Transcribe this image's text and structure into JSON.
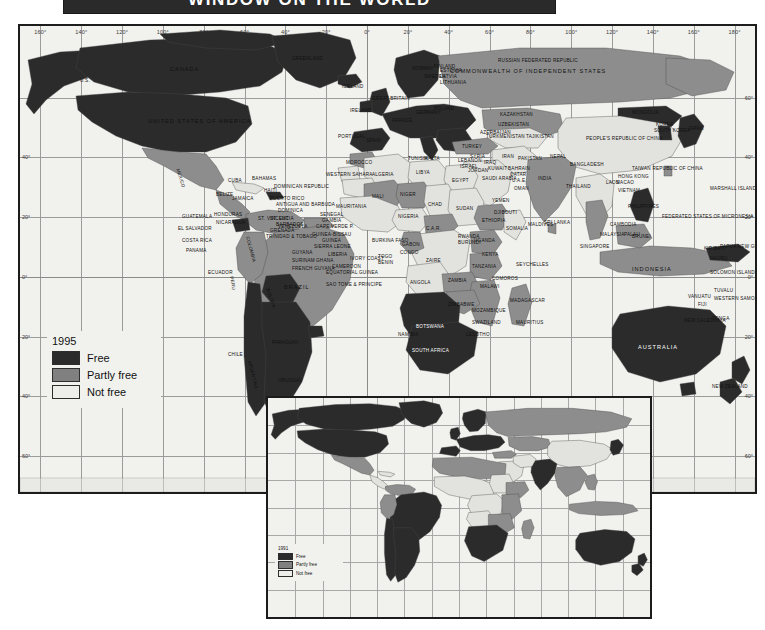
{
  "title": "WINDOW ON THE WORLD",
  "legend_main": {
    "year": "1995",
    "items": [
      {
        "label": "Free",
        "color": "#2b2b2b"
      },
      {
        "label": "Partly free",
        "color": "#808080"
      },
      {
        "label": "Not free",
        "color": "#ededea"
      }
    ]
  },
  "legend_inset": {
    "year": "1991",
    "items": [
      {
        "label": "Free",
        "color": "#2b2b2b"
      },
      {
        "label": "Partly free",
        "color": "#808080"
      },
      {
        "label": "Not free",
        "color": "#ededea"
      }
    ]
  },
  "graticule": {
    "lon_labels": [
      "160°",
      "140°",
      "120°",
      "100°",
      "80°",
      "60°",
      "40°",
      "20°",
      "0°",
      "20°",
      "40°",
      "60°",
      "80°",
      "100°",
      "120°",
      "140°",
      "160°",
      "180°"
    ],
    "lat_labels_left": [
      "40°",
      "20°",
      "0°",
      "20°",
      "40°",
      "60°"
    ],
    "lat_labels_right": [
      "60°",
      "40°",
      "20°",
      "0°",
      "20°",
      "40°",
      "60°"
    ]
  },
  "chart_data": {
    "type": "map",
    "title": "WINDOW ON THE WORLD",
    "categories": [
      "Free",
      "Partly free",
      "Not free"
    ],
    "category_colors": [
      "#2b2b2b",
      "#808080",
      "#ededea"
    ],
    "years": [
      "1995",
      "1991"
    ],
    "projection": "cylindrical",
    "grid": true,
    "legend_position": "bottom-left",
    "countries": [
      {
        "name": "U.S.",
        "status": "Free"
      },
      {
        "name": "CANADA",
        "status": "Free"
      },
      {
        "name": "UNITED STATES OF AMERICA",
        "status": "Free"
      },
      {
        "name": "GREENLAND",
        "status": "Free"
      },
      {
        "name": "ICELAND",
        "status": "Free"
      },
      {
        "name": "NORWAY",
        "status": "Free"
      },
      {
        "name": "SWEDEN",
        "status": "Free"
      },
      {
        "name": "FINLAND",
        "status": "Free"
      },
      {
        "name": "GREAT BRITAIN",
        "status": "Free"
      },
      {
        "name": "IRELAND",
        "status": "Free"
      },
      {
        "name": "PORTUGAL",
        "status": "Free"
      },
      {
        "name": "SPAIN",
        "status": "Free"
      },
      {
        "name": "FRANCE",
        "status": "Free"
      },
      {
        "name": "GERMANY",
        "status": "Free"
      },
      {
        "name": "POLAND",
        "status": "Free"
      },
      {
        "name": "ESTONIA",
        "status": "Free"
      },
      {
        "name": "LATVIA",
        "status": "Free"
      },
      {
        "name": "LITHUANIA",
        "status": "Free"
      },
      {
        "name": "MALTA",
        "status": "Free"
      },
      {
        "name": "RUSSIAN FEDERATED REPUBLIC",
        "status": "Partly free"
      },
      {
        "name": "COMMONWEALTH OF INDEPENDENT STATES",
        "status": "Partly free"
      },
      {
        "name": "KAZAKHSTAN",
        "status": "Partly free"
      },
      {
        "name": "UZBEKISTAN",
        "status": "Not free"
      },
      {
        "name": "TURKMENISTAN",
        "status": "Not free"
      },
      {
        "name": "TAJIKISTAN",
        "status": "Not free"
      },
      {
        "name": "AZERBAIJAN",
        "status": "Partly free"
      },
      {
        "name": "MONGOLIA",
        "status": "Free"
      },
      {
        "name": "PEOPLE'S REPUBLIC OF CHINA",
        "status": "Not free"
      },
      {
        "name": "KOREA",
        "status": "Not free"
      },
      {
        "name": "SOUTH KOREA",
        "status": "Free"
      },
      {
        "name": "JAPAN",
        "status": "Free"
      },
      {
        "name": "TAIWAN REPUBLIC OF CHINA",
        "status": "Partly free"
      },
      {
        "name": "HONG KONG",
        "status": "Partly free"
      },
      {
        "name": "MACAO",
        "status": "Partly free"
      },
      {
        "name": "PHILIPPINES",
        "status": "Free"
      },
      {
        "name": "INDONESIA",
        "status": "Partly free"
      },
      {
        "name": "MALAYSIA",
        "status": "Partly free"
      },
      {
        "name": "BRUNEI",
        "status": "Not free"
      },
      {
        "name": "SINGAPORE",
        "status": "Partly free"
      },
      {
        "name": "CAMBODIA",
        "status": "Partly free"
      },
      {
        "name": "VIETNAM",
        "status": "Not free"
      },
      {
        "name": "LAOS",
        "status": "Not free"
      },
      {
        "name": "THAILAND",
        "status": "Partly free"
      },
      {
        "name": "INDIA",
        "status": "Partly free"
      },
      {
        "name": "PAKISTAN",
        "status": "Partly free"
      },
      {
        "name": "NEPAL",
        "status": "Partly free"
      },
      {
        "name": "BANGLADESH",
        "status": "Partly free"
      },
      {
        "name": "SRI LANKA",
        "status": "Partly free"
      },
      {
        "name": "MALDIVES",
        "status": "Not free"
      },
      {
        "name": "IRAN",
        "status": "Not free"
      },
      {
        "name": "IRAQ",
        "status": "Not free"
      },
      {
        "name": "TURKEY",
        "status": "Partly free"
      },
      {
        "name": "SAUDI ARABIA",
        "status": "Not free"
      },
      {
        "name": "BAHRAIN",
        "status": "Not free"
      },
      {
        "name": "QATAR",
        "status": "Not free"
      },
      {
        "name": "U.A.E.",
        "status": "Not free"
      },
      {
        "name": "OMAN",
        "status": "Not free"
      },
      {
        "name": "YEMEN",
        "status": "Partly free"
      },
      {
        "name": "ISRAEL",
        "status": "Free"
      },
      {
        "name": "JORDAN",
        "status": "Partly free"
      },
      {
        "name": "SYRIA",
        "status": "Not free"
      },
      {
        "name": "LEBANON",
        "status": "Not free"
      },
      {
        "name": "KUWAIT",
        "status": "Partly free"
      },
      {
        "name": "MOROCCO",
        "status": "Partly free"
      },
      {
        "name": "ALGERIA",
        "status": "Not free"
      },
      {
        "name": "TUNISIA",
        "status": "Partly free"
      },
      {
        "name": "LIBYA",
        "status": "Not free"
      },
      {
        "name": "EGYPT",
        "status": "Not free"
      },
      {
        "name": "WESTERN SAHARA",
        "status": "Not free"
      },
      {
        "name": "MAURITANIA",
        "status": "Not free"
      },
      {
        "name": "SENEGAL",
        "status": "Partly free"
      },
      {
        "name": "CAPE VERDE P.",
        "status": "Free"
      },
      {
        "name": "GAMBIA",
        "status": "Not free"
      },
      {
        "name": "GUINEA-BISSAU",
        "status": "Partly free"
      },
      {
        "name": "GUINEA",
        "status": "Not free"
      },
      {
        "name": "SIERRA LEONE",
        "status": "Not free"
      },
      {
        "name": "LIBERIA",
        "status": "Not free"
      },
      {
        "name": "IVORY COAST",
        "status": "Partly free"
      },
      {
        "name": "GHANA",
        "status": "Partly free"
      },
      {
        "name": "TOGO",
        "status": "Not free"
      },
      {
        "name": "BENIN",
        "status": "Free"
      },
      {
        "name": "BURKINA FASO",
        "status": "Not free"
      },
      {
        "name": "MALI",
        "status": "Partly free"
      },
      {
        "name": "NIGER",
        "status": "Partly free"
      },
      {
        "name": "NIGERIA",
        "status": "Not free"
      },
      {
        "name": "CHAD",
        "status": "Not free"
      },
      {
        "name": "SUDAN",
        "status": "Not free"
      },
      {
        "name": "ETHIOPIA",
        "status": "Partly free"
      },
      {
        "name": "SOMALIA",
        "status": "Not free"
      },
      {
        "name": "DJIBOUTI",
        "status": "Not free"
      },
      {
        "name": "C.A.R.",
        "status": "Partly free"
      },
      {
        "name": "CAMEROON",
        "status": "Not free"
      },
      {
        "name": "EQUATORIAL GUINEA",
        "status": "Not free"
      },
      {
        "name": "SAO TOME & PRINCIPE",
        "status": "Free"
      },
      {
        "name": "GABON",
        "status": "Partly free"
      },
      {
        "name": "CONGO",
        "status": "Partly free"
      },
      {
        "name": "ZAIRE",
        "status": "Not free"
      },
      {
        "name": "RWANDA",
        "status": "Not free"
      },
      {
        "name": "BURUNDI",
        "status": "Not free"
      },
      {
        "name": "UGANDA",
        "status": "Partly free"
      },
      {
        "name": "KENYA",
        "status": "Not free"
      },
      {
        "name": "TANZANIA",
        "status": "Partly free"
      },
      {
        "name": "ANGOLA",
        "status": "Not free"
      },
      {
        "name": "ZAMBIA",
        "status": "Partly free"
      },
      {
        "name": "MALAWI",
        "status": "Partly free"
      },
      {
        "name": "MOZAMBIQUE",
        "status": "Partly free"
      },
      {
        "name": "ZIMBABWE",
        "status": "Partly free"
      },
      {
        "name": "BOTSWANA",
        "status": "Free"
      },
      {
        "name": "NAMIBIA",
        "status": "Free"
      },
      {
        "name": "SOUTH AFRICA",
        "status": "Free"
      },
      {
        "name": "SWAZILAND",
        "status": "Partly free"
      },
      {
        "name": "LESOTHO",
        "status": "Partly free"
      },
      {
        "name": "MADAGASCAR",
        "status": "Partly free"
      },
      {
        "name": "COMOROS",
        "status": "Partly free"
      },
      {
        "name": "SEYCHELLES",
        "status": "Partly free"
      },
      {
        "name": "MAURITIUS",
        "status": "Free"
      },
      {
        "name": "MEXICO",
        "status": "Partly free"
      },
      {
        "name": "CUBA",
        "status": "Not free"
      },
      {
        "name": "BAHAMAS",
        "status": "Free"
      },
      {
        "name": "JAMAICA",
        "status": "Free"
      },
      {
        "name": "HAITI",
        "status": "Not free"
      },
      {
        "name": "DOMINICAN REPUBLIC",
        "status": "Free"
      },
      {
        "name": "PUERTO RICO",
        "status": "Free"
      },
      {
        "name": "ANTIGUA AND BARBUDA",
        "status": "Free"
      },
      {
        "name": "DOMINICA",
        "status": "Free"
      },
      {
        "name": "ST. LUCIA",
        "status": "Free"
      },
      {
        "name": "BARBADOS",
        "status": "Free"
      },
      {
        "name": "ST. VINCENT",
        "status": "Free"
      },
      {
        "name": "GRENADA",
        "status": "Free"
      },
      {
        "name": "TRINIDAD & TOBAGO",
        "status": "Free"
      },
      {
        "name": "BELIZE",
        "status": "Free"
      },
      {
        "name": "GUATEMALA",
        "status": "Partly free"
      },
      {
        "name": "EL SALVADOR",
        "status": "Partly free"
      },
      {
        "name": "HONDURAS",
        "status": "Partly free"
      },
      {
        "name": "NICARAGUA",
        "status": "Partly free"
      },
      {
        "name": "COSTA RICA",
        "status": "Free"
      },
      {
        "name": "PANAMA",
        "status": "Free"
      },
      {
        "name": "COLOMBIA",
        "status": "Partly free"
      },
      {
        "name": "VENEZUELA",
        "status": "Free"
      },
      {
        "name": "GUYANA",
        "status": "Free"
      },
      {
        "name": "SURINAM",
        "status": "Partly free"
      },
      {
        "name": "FRENCH GUYANA",
        "status": "Free"
      },
      {
        "name": "ECUADOR",
        "status": "Free"
      },
      {
        "name": "PERU",
        "status": "Partly free"
      },
      {
        "name": "BRAZIL",
        "status": "Partly free"
      },
      {
        "name": "BOLIVIA",
        "status": "Free"
      },
      {
        "name": "CHILE",
        "status": "Free"
      },
      {
        "name": "ARGENTINA",
        "status": "Free"
      },
      {
        "name": "URUGUAY",
        "status": "Free"
      },
      {
        "name": "PARAGUAY",
        "status": "Partly free"
      },
      {
        "name": "AUSTRALIA",
        "status": "Free"
      },
      {
        "name": "NEW ZEALAND",
        "status": "Free"
      },
      {
        "name": "PAPUA NEW GUINEA",
        "status": "Free"
      },
      {
        "name": "FEDERATED STATES OF MICRONESIA",
        "status": "Free"
      },
      {
        "name": "MARSHALL ISLANDS",
        "status": "Free"
      },
      {
        "name": "KIRIBATI",
        "status": "Free"
      },
      {
        "name": "NAURU",
        "status": "Free"
      },
      {
        "name": "TUVALU",
        "status": "Free"
      },
      {
        "name": "WESTERN SAMOA",
        "status": "Partly free"
      },
      {
        "name": "TONGA",
        "status": "Partly free"
      },
      {
        "name": "FIJI",
        "status": "Partly free"
      },
      {
        "name": "VANUATU",
        "status": "Free"
      },
      {
        "name": "SOLOMON ISLANDS",
        "status": "Free"
      },
      {
        "name": "NEW CALEDONIA",
        "status": "Partly free"
      },
      {
        "name": "PALAU",
        "status": "Free"
      },
      {
        "name": "INDONESIA",
        "status": "Partly free"
      }
    ]
  }
}
